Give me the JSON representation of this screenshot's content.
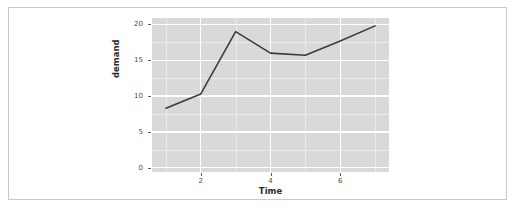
{
  "figure": {
    "background_color": "#ffffff",
    "border_color": "#c9c9c9",
    "panel_color": "#d9d9d9",
    "grid_major_color": "#ffffff",
    "grid_minor_color": "#eaeaea",
    "line_color": "#3c3c3c"
  },
  "chart_data": {
    "type": "line",
    "title": "",
    "xlabel": "Time",
    "ylabel": "demand",
    "x": [
      1,
      2,
      3,
      4,
      5,
      6,
      7
    ],
    "values": [
      8.3,
      10.3,
      19.0,
      16.0,
      15.7,
      17.7,
      19.8
    ],
    "series": [
      {
        "name": "demand",
        "values": [
          8.3,
          10.3,
          19.0,
          16.0,
          15.7,
          17.7,
          19.8
        ]
      }
    ],
    "xlim": [
      0.6,
      7.4
    ],
    "ylim": [
      -0.6,
      20.9
    ],
    "xticks": [
      2,
      4,
      6
    ],
    "xtick_labels": [
      "2",
      "4",
      "6"
    ],
    "yticks": [
      0,
      5,
      10,
      15,
      20
    ],
    "ytick_labels": [
      "0",
      "5",
      "10",
      "15",
      "20"
    ],
    "x_minor_ticks": [
      1,
      3,
      5,
      7
    ],
    "y_minor_ticks": [
      2.5,
      7.5,
      12.5,
      17.5
    ],
    "grid": true,
    "legend": "none"
  }
}
